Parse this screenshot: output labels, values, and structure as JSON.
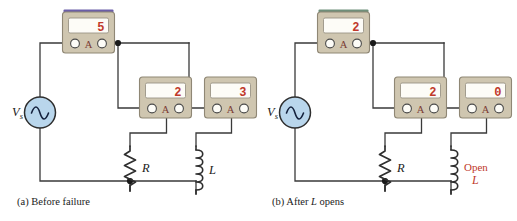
{
  "figure": {
    "type": "circuit-diagram",
    "panels": [
      {
        "id": "a",
        "caption_prefix": "(a)",
        "caption_text": "Before failure",
        "source": {
          "label_main": "V",
          "label_sub": "s",
          "symbol": "ac-source-sine"
        },
        "meters": [
          {
            "name": "total-current-meter",
            "reading": "5",
            "unit": "A"
          },
          {
            "name": "resistor-branch-meter",
            "reading": "2",
            "unit": "A"
          },
          {
            "name": "inductor-branch-meter",
            "reading": "3",
            "unit": "A"
          }
        ],
        "components": [
          {
            "name": "resistor",
            "label": "R",
            "symbol": "zigzag"
          },
          {
            "name": "inductor",
            "label": "L",
            "symbol": "coil"
          }
        ],
        "annotations": []
      },
      {
        "id": "b",
        "caption_prefix": "(b)",
        "caption_text": "After L opens",
        "caption_italic_part": "L",
        "source": {
          "label_main": "V",
          "label_sub": "s",
          "symbol": "ac-source-sine"
        },
        "meters": [
          {
            "name": "total-current-meter",
            "reading": "2",
            "unit": "A"
          },
          {
            "name": "resistor-branch-meter",
            "reading": "2",
            "unit": "A"
          },
          {
            "name": "inductor-branch-meter",
            "reading": "0",
            "unit": "A"
          }
        ],
        "components": [
          {
            "name": "resistor",
            "label": "R",
            "symbol": "zigzag"
          },
          {
            "name": "inductor",
            "label": "L",
            "symbol": "coil"
          }
        ],
        "annotations": [
          {
            "name": "open-fault-label",
            "line1": "Open",
            "line2": "L"
          }
        ]
      }
    ]
  },
  "colors": {
    "wire": "#3a3a3a",
    "meter_body": "#cfc6b0",
    "meter_body_edge": "#8f8775",
    "meter_top_accent_a": "#6b5ea8",
    "meter_top_accent_b": "#6f8f7a",
    "display_face": "#fdfcf7",
    "digit_red": "#c0392b",
    "terminal_fill": "#fdfcf7",
    "source_fill": "#b9d6ec",
    "source_edge": "#3a3a3a",
    "annotation_red": "#c0392b",
    "text": "#1a1a1a"
  }
}
